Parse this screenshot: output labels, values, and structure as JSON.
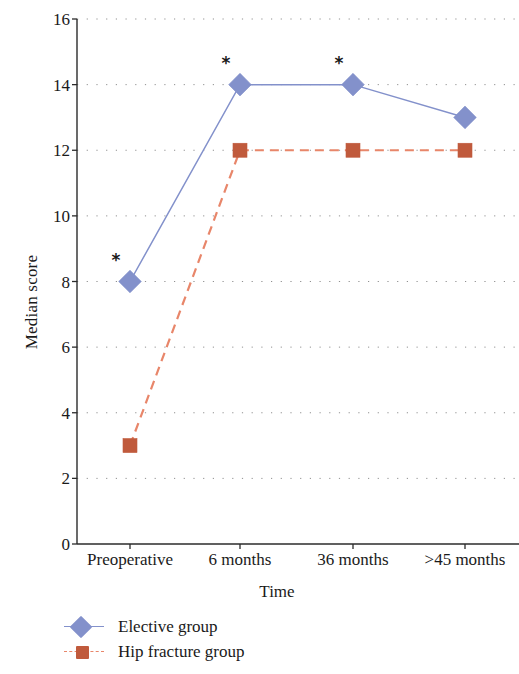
{
  "chart_data": {
    "type": "line",
    "title": "",
    "xlabel": "Time",
    "ylabel": "Median score",
    "categories": [
      "Preoperative",
      "6 months",
      "36 months",
      ">45 months"
    ],
    "series": [
      {
        "name": "Elective group",
        "values": [
          8,
          14,
          14,
          13
        ],
        "color": "#8391cb",
        "line_color": "#8391cb",
        "line_style": "solid",
        "marker": "diamond"
      },
      {
        "name": "Hip fracture group",
        "values": [
          3,
          12,
          12,
          12
        ],
        "color": "#c05a3c",
        "line_color": "#e8866a",
        "line_style": "dashed",
        "marker": "square"
      }
    ],
    "annotations": [
      {
        "label": "*",
        "series": "Elective group",
        "category": "Preoperative",
        "value": 8
      },
      {
        "label": "*",
        "series": "Elective group",
        "category": "6 months",
        "value": 14
      },
      {
        "label": "*",
        "series": "Elective group",
        "category": "36 months",
        "value": 14
      }
    ],
    "ylim": [
      0,
      16
    ],
    "yticks": [
      0,
      2,
      4,
      6,
      8,
      10,
      12,
      14,
      16
    ],
    "ytick_labels": [
      "0",
      "2",
      "4",
      "6",
      "8",
      "10",
      "12",
      "14",
      "16"
    ],
    "grid": "horizontal-dotted",
    "legend_position": "bottom-left"
  },
  "legend": {
    "entries": [
      {
        "label": "Elective group"
      },
      {
        "label": "Hip fracture group"
      }
    ]
  }
}
